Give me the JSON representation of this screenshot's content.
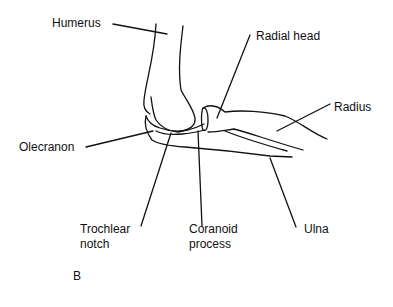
{
  "figure": {
    "panel_label": "B",
    "labels": {
      "humerus": "Humerus",
      "radial_head": "Radial head",
      "radius": "Radius",
      "olecranon": "Olecranon",
      "trochlear_notch_line1": "Trochlear",
      "trochlear_notch_line2": "notch",
      "coranoid_process_line1": "Coranoid",
      "coranoid_process_line2": "process",
      "ulna": "Ulna"
    },
    "colors": {
      "line": "#111111",
      "background": "#ffffff"
    }
  }
}
